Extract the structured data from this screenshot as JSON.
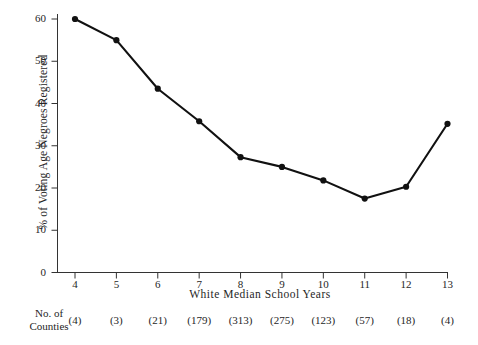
{
  "chart_data": {
    "type": "line",
    "title": "",
    "xlabel": "White Median School Years",
    "ylabel": "% of Voting Age Negroes Registered",
    "xlim": [
      3.5,
      13.5
    ],
    "ylim": [
      0,
      62
    ],
    "grid": false,
    "legend": "none",
    "marker": "filled-circle",
    "line_color": "#111111",
    "marker_color": "#111111",
    "x": [
      4,
      5,
      6,
      7,
      8,
      9,
      10,
      11,
      12,
      13
    ],
    "values": [
      60.0,
      55.0,
      43.5,
      35.8,
      27.3,
      25.0,
      21.8,
      17.5,
      20.3,
      35.2
    ],
    "categories": [
      "4",
      "5",
      "6",
      "7",
      "8",
      "9",
      "10",
      "11",
      "12",
      "13"
    ],
    "series": [
      {
        "name": "% of Voting Age Negroes Registered",
        "values": [
          60.0,
          55.0,
          43.5,
          35.8,
          27.3,
          25.0,
          21.8,
          17.5,
          20.3,
          35.2
        ]
      }
    ],
    "xticks": [
      "4",
      "5",
      "6",
      "7",
      "8",
      "9",
      "10",
      "11",
      "12",
      "13"
    ],
    "yticks": [
      "0",
      "10",
      "20",
      "30",
      "40",
      "50",
      "60"
    ],
    "ytick_values": [
      0,
      10,
      20,
      30,
      40,
      50,
      60
    ],
    "annotation_row": {
      "label_line1": "No. of",
      "label_line2": "Counties",
      "values": [
        "(4)",
        "(3)",
        "(21)",
        "(179)",
        "(313)",
        "(275)",
        "(123)",
        "(57)",
        "(18)",
        "(4)"
      ]
    }
  },
  "colors": {
    "background": "#ffffff",
    "axis": "#333333",
    "line": "#111111",
    "text": "#262626"
  }
}
